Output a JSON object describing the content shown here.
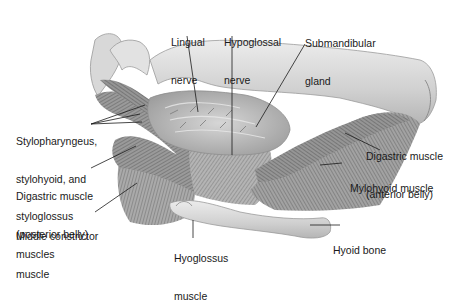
{
  "diagram": {
    "labels": {
      "lingual_nerve": {
        "line1": "Lingual",
        "line2": "nerve"
      },
      "hypoglossal_nerve": {
        "line1": "Hypoglossal",
        "line2": "nerve"
      },
      "submandibular_gland": {
        "line1": "Submandibular",
        "line2": "gland"
      },
      "stylo_muscles": {
        "line1": "Stylopharyngeus,",
        "line2": "stylohyoid, and",
        "line3": "styloglossus",
        "line4": "muscles"
      },
      "digastric_posterior": {
        "line1": "Digastric muscle",
        "line2": "(posterior belly)"
      },
      "middle_constrictor": {
        "line1": "Middle constrictor",
        "line2": "muscle"
      },
      "digastric_anterior": {
        "line1": "Digastric muscle",
        "line2": "(anterior belly)"
      },
      "mylohyoid": {
        "line1": "Mylohyoid muscle"
      },
      "hyoglossus": {
        "line1": "Hyoglossus",
        "line2": "muscle"
      },
      "hyoid_bone": {
        "line1": "Hyoid bone"
      }
    },
    "colors": {
      "bone": "#d9d9d9",
      "bone_shadow": "#a8a8a8",
      "muscle": "#8a8a8a",
      "muscle_dark": "#5e5e5e",
      "gland": "#bdbdbd",
      "leader_line": "#1a1a1a"
    }
  }
}
